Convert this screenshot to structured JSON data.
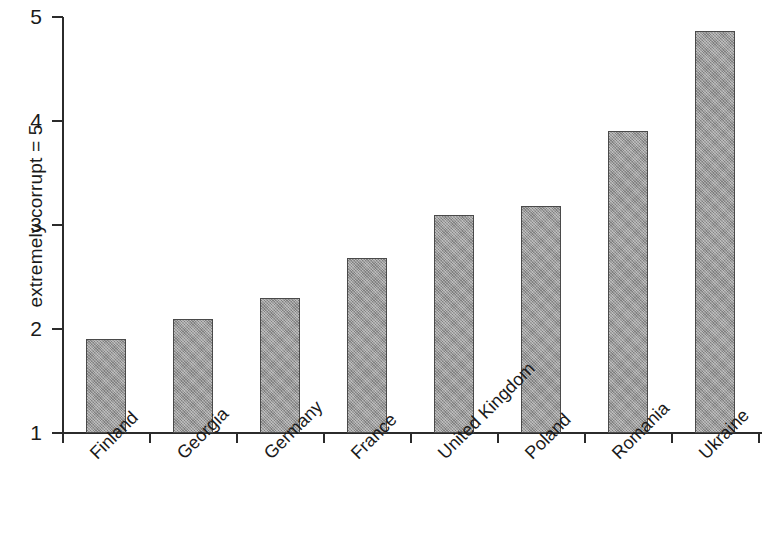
{
  "chart_data": {
    "type": "bar",
    "title": "",
    "xlabel": "",
    "ylabel": "extremely corrupt = 5",
    "categories": [
      "Finland",
      "Georgia",
      "Germany",
      "France",
      "United Kingdom",
      "Poland",
      "Romania",
      "Ukraine"
    ],
    "values": [
      1.9,
      2.1,
      2.3,
      2.68,
      3.1,
      3.18,
      3.9,
      4.87
    ],
    "ylim": [
      1,
      5
    ],
    "yticks": [
      1,
      2,
      3,
      4,
      5
    ],
    "ytick_labels": [
      "1",
      "2",
      "3",
      "4",
      "5"
    ],
    "grid": false,
    "legend": null,
    "legend_position": "none",
    "bar_color": "#9b9b9b",
    "bar_edge_color": "#4a4a4a",
    "axis_color": "#2b2b2b",
    "xlabel_rotation": -45
  }
}
